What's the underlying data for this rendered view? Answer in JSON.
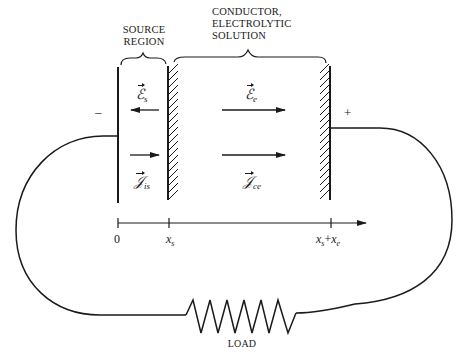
{
  "figure": {
    "regions": {
      "source": {
        "label_line1": "SOURCE",
        "label_line2": "REGION"
      },
      "conductor": {
        "label_line1": "CONDUCTOR,",
        "label_line2": "ELECTROLYTIC",
        "label_line3": "SOLUTION"
      }
    },
    "fields": {
      "source_field": {
        "symbol": "ℰ",
        "subscript": "s",
        "direction": "left"
      },
      "source_current": {
        "symbol": "𝒥",
        "subscript": "is",
        "direction": "right"
      },
      "conductor_field": {
        "symbol": "ℰ",
        "subscript": "e",
        "direction": "right"
      },
      "conductor_current": {
        "symbol": "𝒥",
        "subscript": "ce",
        "direction": "right"
      }
    },
    "terminals": {
      "negative": "–",
      "positive": "+"
    },
    "axis": {
      "ticks": [
        {
          "label": "0"
        },
        {
          "var": "x",
          "sub": "s"
        },
        {
          "var1": "x",
          "sub1": "s",
          "op": "+",
          "var2": "x",
          "sub2": "e"
        }
      ]
    },
    "load": {
      "label": "LOAD"
    },
    "colors": {
      "ink": "#1a1a1a",
      "background": "#ffffff"
    }
  }
}
